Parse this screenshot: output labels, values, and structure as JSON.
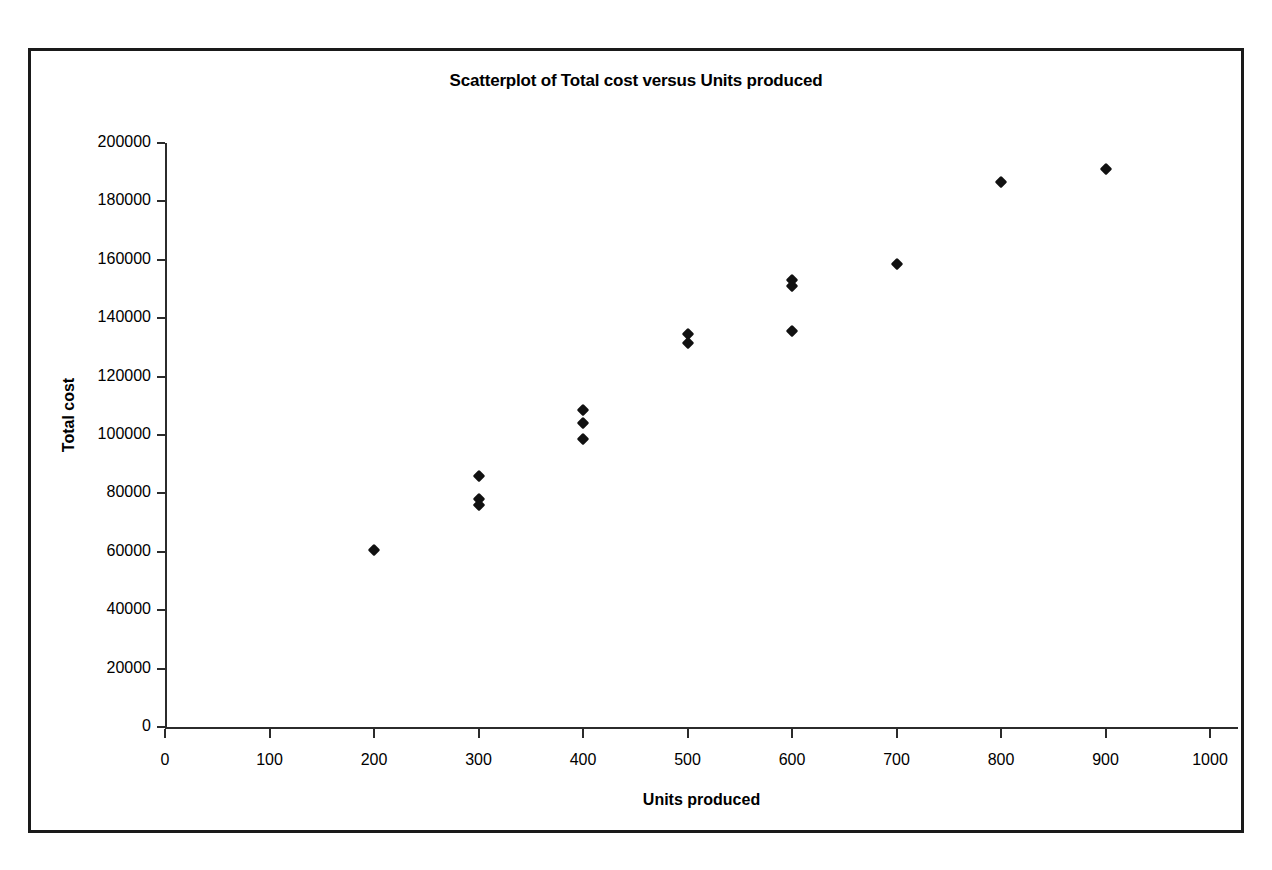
{
  "chart_data": {
    "type": "scatter",
    "title": "Scatterplot of Total cost versus Units produced",
    "xlabel": "Units produced",
    "ylabel": "Total cost",
    "xlim": [
      0,
      1000
    ],
    "ylim": [
      0,
      200000
    ],
    "xticks": [
      0,
      100,
      200,
      300,
      400,
      500,
      600,
      700,
      800,
      900,
      1000
    ],
    "yticks": [
      0,
      20000,
      40000,
      60000,
      80000,
      100000,
      120000,
      140000,
      160000,
      180000,
      200000
    ],
    "xtick_labels": [
      "0",
      "100",
      "200",
      "300",
      "400",
      "500",
      "600",
      "700",
      "800",
      "900",
      "1000"
    ],
    "ytick_labels": [
      "0",
      "20000",
      "40000",
      "60000",
      "80000",
      "100000",
      "120000",
      "140000",
      "160000",
      "180000",
      "200000"
    ],
    "grid": false,
    "legend": false,
    "marker": "diamond",
    "marker_color": "#111111",
    "series": [
      {
        "name": "Total cost",
        "points": [
          {
            "x": 200,
            "y": 60500
          },
          {
            "x": 300,
            "y": 86000
          },
          {
            "x": 300,
            "y": 78000
          },
          {
            "x": 300,
            "y": 76000
          },
          {
            "x": 400,
            "y": 108500
          },
          {
            "x": 400,
            "y": 104000
          },
          {
            "x": 400,
            "y": 98500
          },
          {
            "x": 500,
            "y": 134500
          },
          {
            "x": 500,
            "y": 131500
          },
          {
            "x": 600,
            "y": 153000
          },
          {
            "x": 600,
            "y": 151000
          },
          {
            "x": 600,
            "y": 135500
          },
          {
            "x": 700,
            "y": 158500
          },
          {
            "x": 800,
            "y": 186500
          },
          {
            "x": 900,
            "y": 191000
          }
        ]
      }
    ]
  },
  "frame": {
    "border_color": "#1a1a1a",
    "axis_color": "#2b2b2b"
  }
}
